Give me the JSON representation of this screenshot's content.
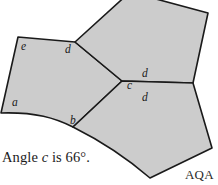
{
  "figure": {
    "fill_color": "#cccccc",
    "stroke_color": "#1a1a1a",
    "background_color": "#ffffff",
    "shapes": [
      {
        "name": "left-pentagon",
        "path": "M 18,37 L 75,42 L 122,81 L 73,127 C 55,118 36,112 1,113 L 18,37 Z"
      },
      {
        "name": "top-pentagon",
        "path": "M 75,42 L 130,-8 L 208,13 L 193,83 L 122,81 Z"
      },
      {
        "name": "bottom-right-pentagon",
        "path": "M 122,81 L 193,83 L 212,148 L 150,178 C 120,152 95,138 73,127 L 122,81 Z"
      }
    ],
    "vertex_labels": [
      {
        "name": "label-e",
        "text": "e",
        "x": 21,
        "y": 50
      },
      {
        "name": "label-d-top-left",
        "text": "d",
        "x": 65,
        "y": 53
      },
      {
        "name": "label-a",
        "text": "a",
        "x": 12,
        "y": 106
      },
      {
        "name": "label-b",
        "text": "b",
        "x": 70,
        "y": 124
      },
      {
        "name": "label-c",
        "text": "c",
        "x": 127,
        "y": 89
      },
      {
        "name": "label-d-upper-right",
        "text": "d",
        "x": 142,
        "y": 77
      },
      {
        "name": "label-d-lower-right",
        "text": "d",
        "x": 142,
        "y": 101
      }
    ]
  },
  "caption": {
    "prefix": "Angle ",
    "variable": "c",
    "suffix": " is 66°."
  },
  "awarding_body": {
    "label": "AQA"
  }
}
